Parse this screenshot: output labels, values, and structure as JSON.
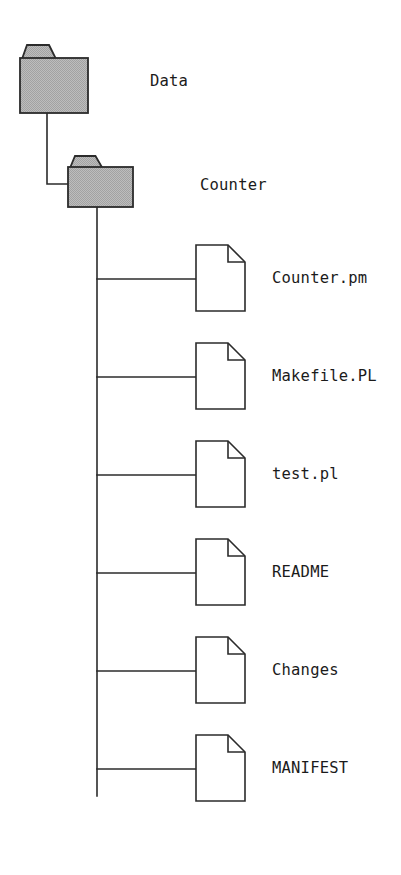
{
  "diagram": {
    "type": "file-system-tree",
    "colors": {
      "stroke": "#2b2b2b",
      "folder_fill": "#b9b9b9",
      "folder_fill_pattern": "#a8a8a8",
      "file_fill": "#ffffff",
      "background": "#ffffff",
      "text": "#1b1b1b"
    },
    "root": {
      "label": "Data",
      "icon": "folder-icon",
      "x": 20,
      "y": 45,
      "width": 68,
      "height": 68,
      "tab_top": 45,
      "body_top": 58,
      "label_x": 150,
      "label_y": 82
    },
    "child_folder": {
      "label": "Counter",
      "icon": "folder-icon",
      "x": 68,
      "y": 156,
      "width": 65,
      "height": 51,
      "tab_top": 156,
      "body_top": 167,
      "label_x": 200,
      "label_y": 186
    },
    "trunk": {
      "x": 97,
      "top": 207,
      "bottom": 796
    },
    "elbow": {
      "from_x": 47,
      "from_y": 113,
      "corner_y": 184,
      "to_x": 68
    },
    "file_geometry": {
      "x": 196,
      "width": 49,
      "height": 66,
      "fold": 17,
      "first_y": 245,
      "spacing": 98,
      "label_x": 272,
      "connector_offset": 34
    },
    "files": [
      {
        "label": "Counter.pm",
        "icon": "file-icon",
        "y": 245
      },
      {
        "label": "Makefile.PL",
        "icon": "file-icon",
        "y": 343
      },
      {
        "label": "test.pl",
        "icon": "file-icon",
        "y": 441
      },
      {
        "label": "README",
        "icon": "file-icon",
        "y": 539
      },
      {
        "label": "Changes",
        "icon": "file-icon",
        "y": 637
      },
      {
        "label": "MANIFEST",
        "icon": "file-icon",
        "y": 735
      }
    ]
  }
}
